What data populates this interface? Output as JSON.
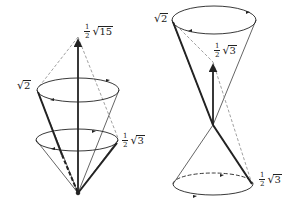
{
  "figures": [
    {
      "id": "left",
      "description": "Two nested cones sharing a bottom apex with a vertical vector",
      "labels": [
        {
          "id": "top",
          "fraction": {
            "num": "1",
            "den": "2"
          },
          "radicand": "15"
        },
        {
          "id": "upper-left",
          "fraction": null,
          "radicand": "2"
        },
        {
          "id": "lower-right",
          "fraction": {
            "num": "1",
            "den": "2"
          },
          "radicand": "3"
        }
      ]
    },
    {
      "id": "right",
      "description": "Double cone crossing at a point with a vertical vector",
      "labels": [
        {
          "id": "upper-left",
          "fraction": null,
          "radicand": "2"
        },
        {
          "id": "center",
          "fraction": {
            "num": "1",
            "den": "2"
          },
          "radicand": "3"
        },
        {
          "id": "lower-right",
          "fraction": {
            "num": "1",
            "den": "2"
          },
          "radicand": "3"
        }
      ]
    }
  ],
  "colors": {
    "line": "#222222",
    "dashed": "#888888",
    "background": "#ffffff"
  }
}
